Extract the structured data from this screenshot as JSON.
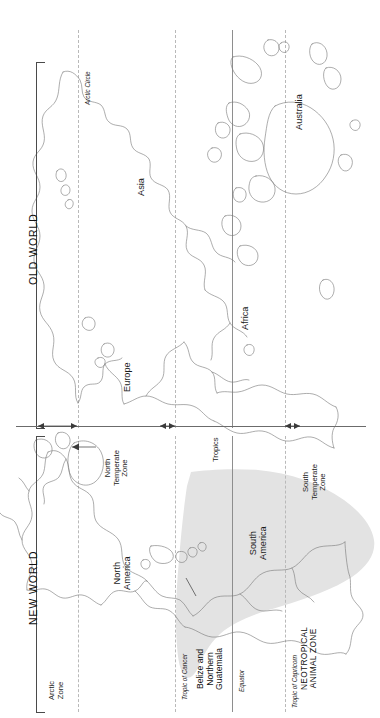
{
  "figure": {
    "orientation": "rotated-90",
    "hemispheres": [
      {
        "id": "old-world",
        "label": "OLD WORLD"
      },
      {
        "id": "new-world",
        "label": "NEW WORLD"
      }
    ],
    "continents": [
      {
        "id": "asia",
        "label": "Asia"
      },
      {
        "id": "australia",
        "label": "Australia"
      },
      {
        "id": "africa",
        "label": "Africa"
      },
      {
        "id": "europe",
        "label": "Europe"
      },
      {
        "id": "north-america",
        "label": "North\nAmerica"
      },
      {
        "id": "south-america",
        "label": "South\nAmerica"
      }
    ],
    "continent_labels": {
      "asia": "Asia",
      "australia": "Australia",
      "africa": "Africa",
      "europe": "Europe",
      "north_america_line1": "North",
      "north_america_line2": "America",
      "south_america_line1": "South",
      "south_america_line2": "America"
    },
    "latitude_lines": [
      {
        "id": "arctic-circle",
        "label": "Arctic Circle",
        "style": "dashed"
      },
      {
        "id": "tropic-of-cancer",
        "label": "Tropic of Cancer",
        "style": "dashed"
      },
      {
        "id": "equator",
        "label": "Equator",
        "style": "solid"
      },
      {
        "id": "tropic-of-capricorn",
        "label": "Tropic of Capricorn",
        "style": "dashed"
      }
    ],
    "climate_zones": [
      {
        "id": "arctic-zone",
        "line1": "Arctic",
        "line2": "Zone",
        "line3": ""
      },
      {
        "id": "north-temperate-zone",
        "line1": "North",
        "line2": "Temperate",
        "line3": "Zone"
      },
      {
        "id": "tropics",
        "line1": "Tropics",
        "line2": "",
        "line3": ""
      },
      {
        "id": "south-temperate-zone",
        "line1": "South",
        "line2": "Temperate",
        "line3": "Zone"
      }
    ],
    "highlight": {
      "id": "neotropical-animal-zone",
      "line1": "NEOTROPICAL",
      "line2": "ANIMAL ZONE",
      "fill_color": "#e3e3e3"
    },
    "callouts": [
      {
        "id": "belize-northern-guatemala",
        "line1": "Belize and",
        "line2": "Northern",
        "line3": "Guatemala"
      }
    ],
    "colors": {
      "background": "#ffffff",
      "coastline": "#7a7a7a",
      "rule": "#4a4a4a",
      "dashed_graticule": "#b9b9b9",
      "solid_graticule": "#8e8e8e",
      "highlight_fill": "#e3e3e3",
      "text": "#1a1a1a"
    }
  }
}
